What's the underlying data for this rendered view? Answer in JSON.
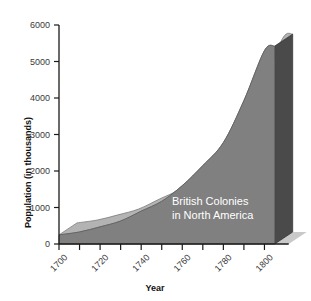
{
  "chart_data": {
    "type": "area",
    "title": "",
    "annotation": [
      "British Colonies",
      "in North America"
    ],
    "xlabel": "Year",
    "ylabel": "Population (in thousands)",
    "xlim": [
      1700,
      1810
    ],
    "ylim": [
      0,
      6000
    ],
    "grid": false,
    "legend_position": "none",
    "style": "3d-extruded-area",
    "ytick_labels": [
      "0",
      "1000",
      "2000",
      "3000",
      "4000",
      "5000",
      "6000"
    ],
    "ytick_values": [
      0,
      1000,
      2000,
      3000,
      4000,
      5000,
      6000
    ],
    "xtick_labels": [
      "1700",
      "1720",
      "1740",
      "1760",
      "1780",
      "1800"
    ],
    "xtick_values": [
      1700,
      1720,
      1740,
      1760,
      1780,
      1800
    ],
    "xtick_minor_values": [
      1710,
      1730,
      1750,
      1770,
      1790
    ],
    "x": [
      1700,
      1710,
      1720,
      1730,
      1740,
      1750,
      1760,
      1770,
      1780,
      1790,
      1800,
      1805
    ],
    "values": [
      250,
      330,
      470,
      630,
      900,
      1170,
      1600,
      2150,
      2780,
      3930,
      5300,
      5420
    ],
    "series": [
      {
        "name": "British Colonies in North America",
        "values": [
          250,
          330,
          470,
          630,
          900,
          1170,
          1600,
          2150,
          2780,
          3930,
          5300,
          5420
        ]
      }
    ],
    "colors": {
      "area_front": "#808080",
      "area_top": "#b3b3b3",
      "area_side": "#4a4a4a",
      "shadow": "#c9c9c9",
      "axis": "#1a1a1a",
      "tick_text": "#3a3a3a",
      "annotation_text": "#ffffff",
      "background": "#ffffff"
    }
  }
}
